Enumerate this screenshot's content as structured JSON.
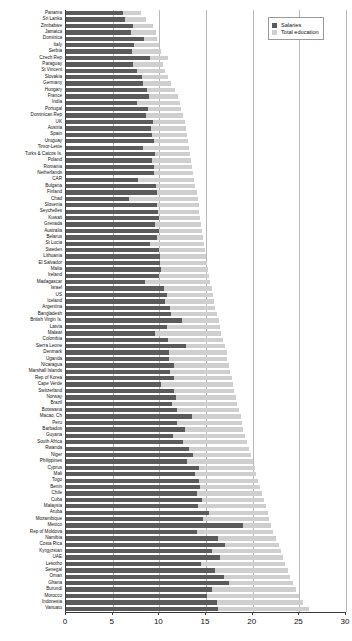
{
  "chart_data": {
    "type": "bar",
    "orientation": "horizontal",
    "stacked": true,
    "title": "",
    "xlabel": "",
    "ylabel": "",
    "xlim": [
      0,
      30
    ],
    "xticks": [
      0,
      5,
      10,
      15,
      20,
      25,
      30
    ],
    "xtick_labels": [
      "0",
      "5",
      "10",
      "15",
      "20",
      "25",
      "30"
    ],
    "grid": true,
    "grid_axis": "x",
    "legend": {
      "position": "top-right",
      "entries": [
        {
          "label": "Salaries",
          "color": "#5b5b5b"
        },
        {
          "label": "Total education",
          "color": "#cfcfcf"
        }
      ]
    },
    "series": [
      {
        "name": "Salaries",
        "color": "#5b5b5b"
      },
      {
        "name": "Total education",
        "color": "#cfcfcf"
      }
    ],
    "categories": [
      "Panama",
      "Sri Lanka",
      "Zimbabwe",
      "Jamaica",
      "Dominica",
      "Italy",
      "Serbia",
      "Czech Rep",
      "Paraguay",
      "St Vincent",
      "Slovakia",
      "Germany",
      "Hungary",
      "France",
      "India",
      "Portugal",
      "Dominican Rep",
      "UK",
      "Austria",
      "Spain",
      "Uruguay",
      "Timor-Leste",
      "Turks & Caicos Is.",
      "Poland",
      "Romania",
      "Netherlands",
      "CAR",
      "Bulgaria",
      "Finland",
      "Chad",
      "Slovenia",
      "Seychelles",
      "Kuwait",
      "Grenada",
      "Australia",
      "Belarus",
      "St Lucia",
      "Sweden",
      "Lithuania",
      "El Salvador",
      "Malta",
      "Ireland",
      "Madagascar",
      "Israel",
      "US",
      "Iceland",
      "Argentina",
      "Bangladesh",
      "British Virgin Is.",
      "Latvia",
      "Malawi",
      "Colombia",
      "Sierra Leone",
      "Denmark",
      "Uganda",
      "Nicaragua",
      "Marshall Islands",
      "Rep of Korea",
      "Cape Verde",
      "Switzerland",
      "Norway",
      "Brazil",
      "Botswana",
      "Macao, Ch",
      "Peru",
      "Barbados",
      "Guyana",
      "South Africa",
      "Rwanda",
      "Niger",
      "Philippines",
      "Cyprus",
      "Mali",
      "Togo",
      "Benin",
      "Chile",
      "Cuba",
      "Malaysia",
      "Aruba",
      "Mozambique",
      "Mexico",
      "Rep of Moldova",
      "Namibia",
      "Costa Rica",
      "Kyrgyzstan",
      "UAE",
      "Lesotho",
      "Senegal",
      "Oman",
      "Ghana",
      "Burundi",
      "Morocco",
      "Indonesia",
      "Vanuatu"
    ],
    "salaries": [
      6.1,
      6.3,
      7.2,
      7.0,
      8.4,
      7.3,
      7.1,
      9.0,
      7.2,
      7.6,
      8.1,
      8.3,
      8.7,
      8.9,
      7.6,
      8.8,
      8.6,
      9.3,
      9.1,
      9.2,
      9.4,
      8.2,
      9.5,
      9.2,
      9.4,
      9.4,
      7.7,
      9.6,
      9.8,
      6.7,
      9.8,
      9.9,
      10.0,
      9.5,
      10.0,
      9.8,
      9.0,
      10.0,
      10.1,
      10.1,
      10.2,
      10.0,
      8.5,
      10.5,
      10.8,
      10.6,
      11.1,
      11.3,
      12.4,
      10.8,
      9.5,
      10.9,
      12.9,
      11.0,
      11.0,
      11.6,
      11.1,
      11.6,
      10.2,
      11.6,
      11.8,
      11.4,
      11.9,
      13.5,
      11.9,
      12.7,
      11.5,
      12.5,
      13.2,
      13.6,
      13.0,
      14.2,
      13.8,
      14.3,
      14.4,
      14.0,
      14.6,
      14.1,
      15.3,
      14.7,
      19.0,
      14.0,
      16.3,
      17.0,
      15.6,
      16.5,
      14.5,
      16.0,
      16.9,
      17.5,
      15.6,
      15.1,
      16.2,
      16.3,
      24.3
    ],
    "total_education": [
      8.0,
      8.6,
      9.3,
      9.6,
      9.8,
      10.0,
      10.2,
      10.9,
      10.4,
      10.6,
      10.9,
      11.3,
      11.7,
      12.0,
      12.2,
      12.3,
      12.5,
      12.7,
      12.9,
      13.0,
      13.1,
      13.2,
      13.3,
      13.4,
      13.5,
      13.6,
      13.7,
      13.8,
      14.0,
      14.1,
      14.2,
      14.3,
      14.4,
      14.5,
      14.6,
      14.7,
      14.8,
      14.9,
      15.0,
      15.1,
      15.2,
      15.3,
      15.4,
      15.6,
      15.8,
      15.9,
      16.0,
      16.2,
      16.4,
      16.5,
      16.6,
      16.8,
      17.0,
      17.2,
      17.3,
      17.5,
      17.6,
      17.8,
      17.9,
      18.0,
      18.2,
      18.3,
      18.5,
      18.7,
      18.9,
      19.0,
      19.2,
      19.4,
      19.6,
      19.8,
      20.0,
      20.2,
      20.4,
      20.6,
      20.8,
      21.0,
      21.2,
      21.4,
      21.6,
      21.8,
      22.0,
      22.2,
      22.5,
      22.8,
      23.0,
      23.2,
      23.5,
      23.8,
      24.0,
      24.3,
      24.6,
      25.0,
      25.4,
      26.0,
      28.1
    ]
  }
}
